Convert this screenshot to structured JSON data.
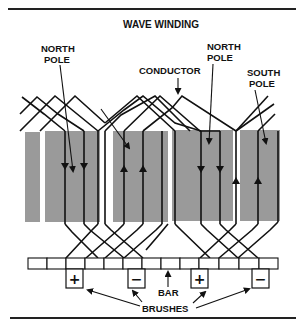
{
  "diagram": {
    "title": "WAVE WINDING",
    "labels": {
      "north_pole_left_line1": "NORTH",
      "north_pole_left_line2": "POLE",
      "north_pole_right_line1": "NORTH",
      "north_pole_right_line2": "POLE",
      "south_pole_line1": "SOUTH",
      "south_pole_line2": "POLE",
      "conductor": "CONDUCTOR",
      "bar": "BAR",
      "brushes": "BRUSHES"
    },
    "brushes": [
      {
        "sign": "+",
        "polarity": "positive"
      },
      {
        "sign": "−",
        "polarity": "negative"
      },
      {
        "sign": "+",
        "polarity": "positive"
      },
      {
        "sign": "−",
        "polarity": "negative"
      }
    ],
    "commutator_segment_count": 13,
    "pole_blocks": 5,
    "current_directions": [
      "down",
      "down",
      "up",
      "up",
      "down",
      "down",
      "up",
      "up"
    ],
    "colors": {
      "pole_fill": "#9a9a9a",
      "line": "#111111",
      "background": "#ffffff"
    }
  }
}
